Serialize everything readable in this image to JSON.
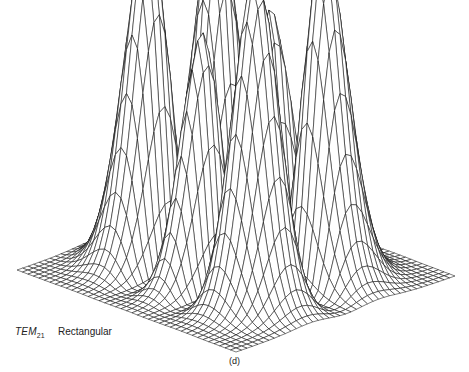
{
  "figure": {
    "mode_label": "TEM",
    "mode_subscript": "21",
    "type_label": "Rectangular",
    "panel_label": "(d)"
  },
  "chart_data": {
    "type": "wireframe-surface",
    "mode_indices": {
      "m": 2,
      "n": 1
    },
    "grid": {
      "nx": 40,
      "ny": 40,
      "range": [
        -3.2,
        3.2
      ]
    },
    "projection": {
      "left_corner": [
        17,
        270
      ],
      "front_corner": [
        236,
        352
      ],
      "right_corner": [
        455,
        276
      ],
      "z_scale": 330
    },
    "peak_screen_positions": [
      {
        "x": 143,
        "y": 34
      },
      {
        "x": 182,
        "y": 87
      },
      {
        "x": 231,
        "y": 13
      },
      {
        "x": 282,
        "y": 98
      },
      {
        "x": 329,
        "y": 38
      }
    ],
    "line_color": "#111111",
    "background": "#ffffff"
  }
}
